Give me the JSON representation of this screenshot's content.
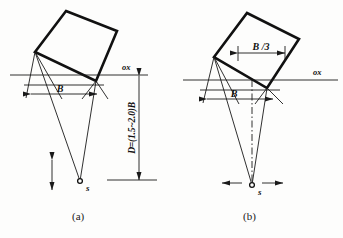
{
  "figure": {
    "background_color": "#fdfdfc",
    "line_color": "#111111",
    "panels": [
      {
        "caption": "(a)",
        "axis_label": "ox",
        "width_label": "B",
        "depth_label": "D=(1.5~2.0)B",
        "source_label": "s",
        "arrow_orientation": "vertical"
      },
      {
        "caption": "(b)",
        "axis_label": "ox",
        "width_label": "B",
        "inner_label": "B /3",
        "source_label": "s",
        "arrow_orientation": "horizontal"
      }
    ]
  }
}
